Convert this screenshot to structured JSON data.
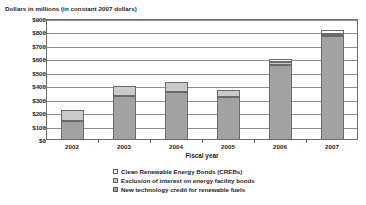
{
  "chart_data": {
    "type": "bar",
    "subtype": "stacked-vertical",
    "title": "Dollars in millions (in constant 2007 dollars)",
    "xlabel": "Fiscal year",
    "ylabel": "",
    "categories": [
      "2002",
      "2003",
      "2004",
      "2005",
      "2006",
      "2007"
    ],
    "ytick_labels": [
      "$0",
      "$100",
      "$200",
      "$300",
      "$400",
      "$500",
      "$600",
      "$700",
      "$800",
      "$900"
    ],
    "ytick_values": [
      0,
      100,
      200,
      300,
      400,
      500,
      600,
      700,
      800,
      900
    ],
    "ylim": [
      0,
      900
    ],
    "grid": true,
    "grid_axis": "y",
    "legend_position": "bottom",
    "series": [
      {
        "name": "New technology credit for renewable fuels",
        "swatch": "dark",
        "color": "#a2a2a2",
        "values": [
          145,
          330,
          360,
          320,
          560,
          770
        ]
      },
      {
        "name": "Exclusion of interest on energy facility bonds",
        "swatch": "mid",
        "color": "#cacaca",
        "values": [
          80,
          70,
          70,
          55,
          20,
          20
        ]
      },
      {
        "name": "Clean Renewable Energy Bonds (CREBs)",
        "swatch": "light",
        "color": "#ffffff",
        "values": [
          0,
          0,
          0,
          0,
          25,
          25
        ]
      }
    ],
    "totals": [
      225,
      400,
      430,
      375,
      605,
      815
    ]
  },
  "legend": {
    "items": [
      {
        "label": "Clean Renewable Energy Bonds (CREBs)"
      },
      {
        "label": "Exclusion of interest on energy facility bonds"
      },
      {
        "label": "New technology credit for renewable fuels"
      }
    ]
  }
}
